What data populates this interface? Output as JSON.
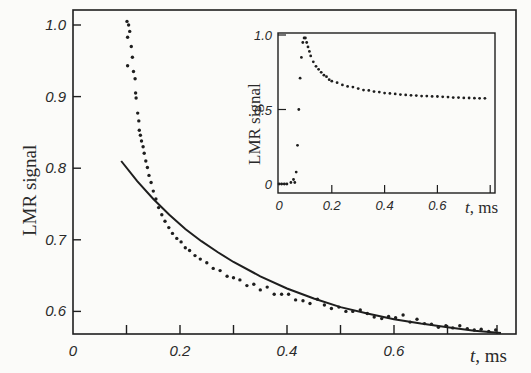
{
  "chart_data": [
    {
      "id": "main",
      "type": "scatter",
      "title": "",
      "xlabel": "t, ms",
      "ylabel": "LMR signal",
      "xlim": [
        0,
        0.8
      ],
      "ylim": [
        0.57,
        1.02
      ],
      "xticks": [
        0,
        0.1,
        0.2,
        0.3,
        0.4,
        0.5,
        0.6,
        0.7
      ],
      "xtick_labels": [
        "0",
        "",
        "0.2",
        "",
        "0.4",
        "",
        "0.6",
        ""
      ],
      "yticks": [
        0.6,
        0.7,
        0.8,
        0.9,
        1.0
      ],
      "ytick_labels": [
        "0.6",
        "0.7",
        "0.8",
        "0.9",
        "1.0"
      ],
      "grid": false,
      "legend": null,
      "series": [
        {
          "name": "measured",
          "style": "dots",
          "x": [
            0.101,
            0.104,
            0.102,
            0.106,
            0.102,
            0.109,
            0.111,
            0.113,
            0.116,
            0.117,
            0.118,
            0.121,
            0.123,
            0.124,
            0.126,
            0.128,
            0.131,
            0.133,
            0.136,
            0.139,
            0.142,
            0.146,
            0.15,
            0.155,
            0.16,
            0.166,
            0.172,
            0.179,
            0.186,
            0.194,
            0.202,
            0.21,
            0.218,
            0.228,
            0.238,
            0.25,
            0.262,
            0.275,
            0.288,
            0.3,
            0.312,
            0.325,
            0.338,
            0.35,
            0.363,
            0.376,
            0.39,
            0.403,
            0.416,
            0.43,
            0.443,
            0.457,
            0.47,
            0.483,
            0.497,
            0.51,
            0.523,
            0.537,
            0.55,
            0.563,
            0.577,
            0.59,
            0.603,
            0.617,
            0.63,
            0.643,
            0.657,
            0.67,
            0.683,
            0.697,
            0.71,
            0.723,
            0.737,
            0.75,
            0.763,
            0.777,
            0.79
          ],
          "y": [
            1.005,
            1.0,
            0.983,
            0.991,
            0.943,
            0.97,
            0.955,
            0.935,
            0.925,
            0.905,
            0.898,
            0.877,
            0.866,
            0.853,
            0.846,
            0.838,
            0.83,
            0.821,
            0.81,
            0.801,
            0.79,
            0.78,
            0.768,
            0.757,
            0.745,
            0.735,
            0.726,
            0.717,
            0.709,
            0.702,
            0.697,
            0.689,
            0.685,
            0.678,
            0.673,
            0.668,
            0.66,
            0.657,
            0.649,
            0.647,
            0.644,
            0.636,
            0.638,
            0.63,
            0.634,
            0.624,
            0.624,
            0.624,
            0.616,
            0.615,
            0.611,
            0.617,
            0.609,
            0.604,
            0.606,
            0.6,
            0.6,
            0.602,
            0.597,
            0.592,
            0.59,
            0.593,
            0.591,
            0.595,
            0.585,
            0.589,
            0.583,
            0.582,
            0.578,
            0.58,
            0.577,
            0.58,
            0.576,
            0.574,
            0.575,
            0.572,
            0.574
          ]
        },
        {
          "name": "fit",
          "style": "line",
          "x": [
            0.09,
            0.12,
            0.15,
            0.18,
            0.21,
            0.24,
            0.27,
            0.3,
            0.35,
            0.4,
            0.45,
            0.5,
            0.55,
            0.6,
            0.65,
            0.7,
            0.75,
            0.8
          ],
          "y": [
            0.81,
            0.782,
            0.757,
            0.735,
            0.715,
            0.698,
            0.683,
            0.669,
            0.649,
            0.632,
            0.618,
            0.606,
            0.597,
            0.589,
            0.583,
            0.578,
            0.573,
            0.57
          ]
        }
      ]
    },
    {
      "id": "inset",
      "type": "scatter",
      "title": "",
      "xlabel": "t, ms",
      "ylabel": "LMR signal",
      "xlim": [
        0,
        0.8
      ],
      "ylim": [
        -0.05,
        1.02
      ],
      "xticks": [
        0,
        0.2,
        0.4,
        0.6
      ],
      "xtick_labels": [
        "0",
        "0.2",
        "0.4",
        "0.6"
      ],
      "yticks": [
        0,
        0.5,
        1.0
      ],
      "ytick_labels": [
        "0",
        "0.5",
        "1.0"
      ],
      "grid": false,
      "legend": null,
      "series": [
        {
          "name": "measured",
          "style": "dots",
          "x": [
            0.0,
            0.01,
            0.02,
            0.03,
            0.045,
            0.055,
            0.06,
            0.065,
            0.07,
            0.075,
            0.08,
            0.085,
            0.09,
            0.095,
            0.1,
            0.105,
            0.11,
            0.115,
            0.12,
            0.13,
            0.14,
            0.15,
            0.16,
            0.17,
            0.18,
            0.19,
            0.2,
            0.22,
            0.24,
            0.26,
            0.28,
            0.3,
            0.32,
            0.34,
            0.36,
            0.38,
            0.4,
            0.42,
            0.44,
            0.46,
            0.48,
            0.5,
            0.52,
            0.54,
            0.56,
            0.58,
            0.6,
            0.62,
            0.64,
            0.66,
            0.68,
            0.7,
            0.72,
            0.74,
            0.76,
            0.78
          ],
          "y": [
            0.0,
            0.0,
            0.0,
            0.0,
            0.01,
            0.03,
            0.01,
            0.08,
            0.26,
            0.5,
            0.71,
            0.85,
            0.95,
            0.98,
            0.98,
            0.95,
            0.92,
            0.89,
            0.86,
            0.82,
            0.79,
            0.77,
            0.75,
            0.73,
            0.72,
            0.7,
            0.69,
            0.68,
            0.665,
            0.655,
            0.65,
            0.64,
            0.63,
            0.628,
            0.62,
            0.617,
            0.61,
            0.608,
            0.605,
            0.6,
            0.598,
            0.595,
            0.593,
            0.59,
            0.59,
            0.588,
            0.587,
            0.585,
            0.583,
            0.58,
            0.58,
            0.578,
            0.577,
            0.576,
            0.575,
            0.575
          ]
        }
      ]
    }
  ],
  "labels": {
    "main_ylabel": "LMR signal",
    "main_xlabel_t": "t",
    "main_xlabel_unit": ", ms",
    "inset_ylabel": "LMR signal",
    "inset_xlabel_t": "t",
    "inset_xlabel_unit": ", ms"
  },
  "colors": {
    "background": "#fbfbf9",
    "ink": "#1e1e1e"
  }
}
